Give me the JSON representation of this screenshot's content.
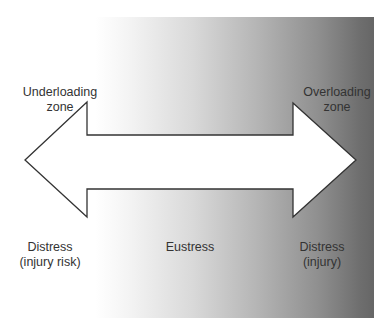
{
  "diagram": {
    "type": "double-headed arrow over gradient",
    "gradient": {
      "from_color": "#ffffff",
      "to_color": "#666666",
      "direction": "left-to-right"
    },
    "arrow": {
      "fill": "#ffffff",
      "stroke": "#333333"
    },
    "top_labels": {
      "left": [
        "Underloading",
        "zone"
      ],
      "right": [
        "Overloading",
        "zone"
      ]
    },
    "bottom_labels": {
      "left": [
        "Distress",
        "(injury risk)"
      ],
      "center": [
        "Eustress"
      ],
      "right": [
        "Distress",
        "(injury)"
      ]
    }
  }
}
